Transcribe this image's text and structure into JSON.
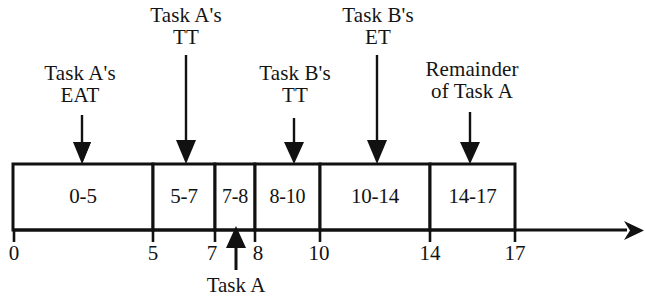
{
  "diagram": {
    "type": "timeline-gantt",
    "stroke_color": "#111111",
    "background_color": "#ffffff",
    "axis": {
      "start_time": 0,
      "end_time": 17,
      "tick_labels": [
        "0",
        "5",
        "7",
        "8",
        "10",
        "14",
        "17"
      ],
      "tick_values": [
        0,
        5,
        7,
        8,
        10,
        14,
        17
      ],
      "arrow_direction": "right"
    },
    "segments": [
      {
        "label": "0-5",
        "start": 0,
        "end": 5
      },
      {
        "label": "5-7",
        "start": 5,
        "end": 7
      },
      {
        "label": "7-8",
        "start": 7,
        "end": 8
      },
      {
        "label": "8-10",
        "start": 8,
        "end": 10
      },
      {
        "label": "10-14",
        "start": 10,
        "end": 14
      },
      {
        "label": "14-17",
        "start": 14,
        "end": 17
      }
    ],
    "top_annotations": [
      {
        "line1": "Task A's",
        "line2": "EAT",
        "points_to_time": 2.6,
        "points_to_segment": "0-5"
      },
      {
        "line1": "Task A's",
        "line2": "TT",
        "points_to_time": 6.1,
        "points_to_segment": "5-7"
      },
      {
        "line1": "Task B's",
        "line2": "TT",
        "points_to_time": 9.6,
        "points_to_segment": "8-10"
      },
      {
        "line1": "Task B's",
        "line2": "ET",
        "points_to_time": 12.3,
        "points_to_segment": "10-14"
      },
      {
        "line1": "Remainder",
        "line2": "of Task A",
        "points_to_time": 15.4,
        "points_to_segment": "14-17"
      }
    ],
    "bottom_annotation": {
      "label": "Task A",
      "points_to_time": 7.5,
      "arrow_direction": "up"
    }
  }
}
